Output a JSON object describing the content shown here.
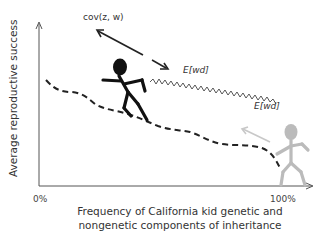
{
  "diagram": {
    "y_axis_label": "Average reproductive success",
    "x_axis_label_line1": "Frequency of California kid genetic and",
    "x_axis_label_line2": "nongenetic components of inheritance",
    "x_tick_left": "0%",
    "x_tick_right": "100%",
    "annotations": {
      "cov": "cov(z, w)",
      "ewd_black": "E[wd]",
      "ewd_gray": "E[wd]"
    },
    "colors": {
      "axis": "#555555",
      "dark_figure": "#111111",
      "light_figure": "#bbbbbb",
      "dashed_line": "#222222",
      "wavy_line": "#444444",
      "gray_arrow": "#c8c8c8"
    }
  }
}
